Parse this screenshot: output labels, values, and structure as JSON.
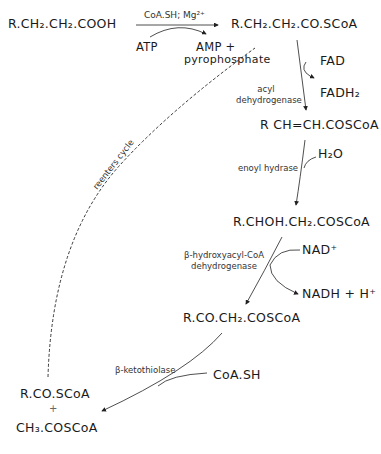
{
  "diagram": {
    "nodes": {
      "fatty_acid": "R.CH₂.CH₂.COOH",
      "acyl_coa": "R.CH₂.CH₂.CO.SCoA",
      "enoyl_coa": "R CH=CH.COSCoA",
      "hydroxyacyl_coa": "R.CHOH.CH₂.COSCoA",
      "ketoacyl_coa": "R.CO.CH₂.COSCoA",
      "product_acyl": "R.CO.SCoA",
      "plus": "+",
      "product_acetyl": "CH₃.COSCoA"
    },
    "cofactors": {
      "activation_top": "CoA.SH; Mg²⁺",
      "atp": "ATP",
      "amp": "AMP +",
      "pyrophosphate": "pyrophosphate",
      "fad": "FAD",
      "fadh2": "FADH₂",
      "h2o": "H₂O",
      "nad": "NAD⁺",
      "nadh": "NADH + H⁺",
      "coash": "CoA.SH"
    },
    "enzymes": {
      "acyl_dehydrogenase_1": "acyl",
      "acyl_dehydrogenase_2": "dehydrogenase",
      "enoyl_hydrase": "enoyl hydrase",
      "hydroxyacyl_1": "β-hydroxyacyl-CoA",
      "hydroxyacyl_2": "dehydrogenase",
      "ketothiolase": "β-ketothiolase"
    },
    "cycle_label": "reenters cycle"
  }
}
